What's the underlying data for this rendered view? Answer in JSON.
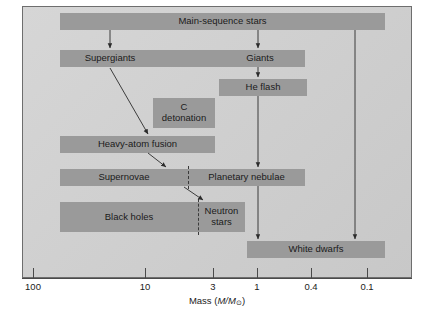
{
  "figure": {
    "type": "flow-diagram",
    "colors": {
      "panel_background": "#cfcfcf",
      "box_fill": "#9a9a9a",
      "text": "#1b1b1b",
      "line": "#3a3a3a",
      "frame_border": "#6e6e6e"
    }
  },
  "axis": {
    "title_prefix": "Mass (",
    "title_var": "M/M",
    "title_sun": "⊙",
    "title_suffix": ")",
    "title_full": "Mass (M/M⊙)",
    "scale": "logarithmic-decreasing",
    "ticks": [
      {
        "label": "100",
        "x": 33
      },
      {
        "label": "10",
        "x": 145
      },
      {
        "label": "3",
        "x": 213
      },
      {
        "label": "1",
        "x": 257
      },
      {
        "label": "0.4",
        "x": 311
      },
      {
        "label": "0.1",
        "x": 367
      }
    ]
  },
  "boxes": [
    {
      "id": "main-sequence-stars",
      "label": "Main-sequence stars",
      "x": 60,
      "y": 13,
      "w": 325,
      "h": 17
    },
    {
      "id": "he-flash",
      "label": "He flash",
      "x": 219,
      "y": 79,
      "w": 88,
      "h": 17
    },
    {
      "id": "c-detonation",
      "label": "C\ndetonation",
      "x": 153,
      "y": 98,
      "w": 62,
      "h": 30
    },
    {
      "id": "heavy-atom-fusion",
      "label": "Heavy-atom fusion",
      "x": 60,
      "y": 136,
      "w": 155,
      "h": 17
    },
    {
      "id": "white-dwarfs",
      "label": "White dwarfs",
      "x": 247,
      "y": 241,
      "w": 138,
      "h": 17
    }
  ],
  "split_bars": [
    {
      "id": "supergiants-giants",
      "x": 60,
      "y": 50,
      "w": 245,
      "h": 17,
      "divider_x": null,
      "segments": [
        {
          "id": "supergiants",
          "label": "Supergiants",
          "x": 60,
          "w": 100
        },
        {
          "id": "giants",
          "label": "Giants",
          "x": 215,
          "w": 90
        }
      ]
    },
    {
      "id": "supernovae-planetary-nebulae",
      "x": 60,
      "y": 169,
      "w": 245,
      "h": 17,
      "divider_x": 188,
      "segments": [
        {
          "id": "supernovae",
          "label": "Supernovae",
          "x": 60,
          "w": 128
        },
        {
          "id": "planetary-nebulae",
          "label": "Planetary nebulae",
          "x": 188,
          "w": 117
        }
      ]
    },
    {
      "id": "black-holes-neutron-stars",
      "x": 60,
      "y": 202,
      "w": 185,
      "h": 30,
      "divider_x": 198,
      "segments": [
        {
          "id": "black-holes",
          "label": "Black holes",
          "x": 60,
          "w": 138
        },
        {
          "id": "neutron-stars",
          "label": "Neutron\nstars",
          "x": 198,
          "w": 47
        }
      ]
    }
  ],
  "arrows": [
    {
      "id": "main-sequence-to-supergiants",
      "x1": 110,
      "y1": 30,
      "x2": 110,
      "y2": 48,
      "kind": "vertical"
    },
    {
      "id": "main-sequence-to-giants",
      "x1": 258,
      "y1": 30,
      "x2": 258,
      "y2": 48,
      "kind": "vertical"
    },
    {
      "id": "giants-to-he-flash",
      "x1": 258,
      "y1": 67,
      "x2": 258,
      "y2": 77,
      "kind": "vertical"
    },
    {
      "id": "he-flash-to-planetary-nebulae",
      "x1": 258,
      "y1": 96,
      "x2": 258,
      "y2": 167,
      "kind": "vertical"
    },
    {
      "id": "planetary-nebulae-to-white-dwarfs",
      "x1": 258,
      "y1": 186,
      "x2": 258,
      "y2": 239,
      "kind": "vertical"
    },
    {
      "id": "main-sequence-to-white-dwarfs",
      "x1": 355,
      "y1": 30,
      "x2": 355,
      "y2": 239,
      "kind": "vertical"
    },
    {
      "id": "supergiants-to-heavy-atom-fusion",
      "x1": 110,
      "y1": 68,
      "x2": 148,
      "y2": 134,
      "kind": "diagonal"
    },
    {
      "id": "heavy-atom-fusion-to-supernovae",
      "x1": 148,
      "y1": 153,
      "x2": 166,
      "y2": 167,
      "kind": "diagonal"
    },
    {
      "id": "supernovae-to-neutron-stars",
      "x1": 184,
      "y1": 187,
      "x2": 203,
      "y2": 200,
      "kind": "diagonal"
    }
  ]
}
